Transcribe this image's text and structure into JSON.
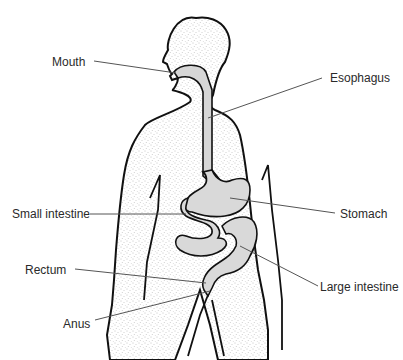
{
  "diagram": {
    "labels": {
      "mouth": "Mouth",
      "esophagus": "Esophagus",
      "small_intestine": "Small intestine",
      "stomach": "Stomach",
      "rectum": "Rectum",
      "large_intestine": "Large intestine",
      "anus": "Anus"
    },
    "colors": {
      "outline": "#111111",
      "body_stipple": "#8a8a8a",
      "organ_fill": "#d9d9d9",
      "leader_line": "#555555",
      "background": "#ffffff"
    }
  }
}
